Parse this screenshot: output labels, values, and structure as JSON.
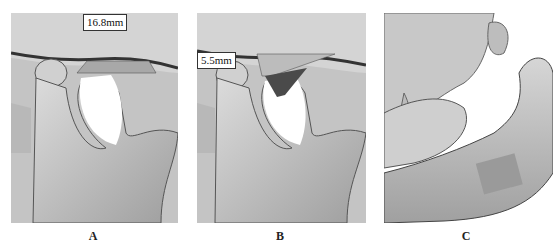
{
  "figure": {
    "panels": [
      {
        "id": "A",
        "label": "A",
        "measurement": "16.8mm",
        "description": "3D CT reconstruction of TMJ, condyle and articular eminence, measurement width"
      },
      {
        "id": "B",
        "label": "B",
        "measurement": "5.5mm",
        "description": "3D CT reconstruction of TMJ, measurement of eminence height"
      },
      {
        "id": "C",
        "label": "C",
        "measurement": null,
        "description": "3D CT reconstruction of mandible and maxilla, lateral view"
      }
    ]
  },
  "colors": {
    "bone_light": "#d8d8d8",
    "bone_mid": "#b0b0b0",
    "bone_dark": "#707070",
    "shadow": "#2a2a2a",
    "background": "#ffffff"
  }
}
